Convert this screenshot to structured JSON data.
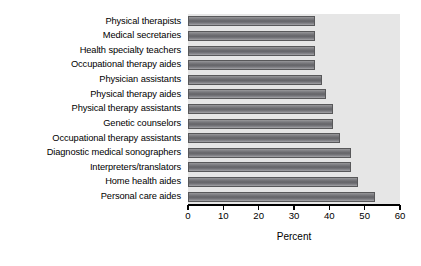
{
  "chart_data": {
    "type": "bar",
    "orientation": "horizontal",
    "title": "",
    "xlabel": "Percent",
    "ylabel": "",
    "xlim": [
      0,
      60
    ],
    "xticks": [
      0,
      10,
      20,
      30,
      40,
      50,
      60
    ],
    "grid": false,
    "legend": null,
    "categories": [
      "Physical therapists",
      "Medical secretaries",
      "Health specialty teachers",
      "Occupational therapy aides",
      "Physician assistants",
      "Physical therapy aides",
      "Physical therapy assistants",
      "Genetic counselors",
      "Occupational therapy assistants",
      "Diagnostic medical sonographers",
      "Interpreters/translators",
      "Home health aides",
      "Personal care aides"
    ],
    "values": [
      36,
      36,
      36,
      36,
      38,
      39,
      41,
      41,
      43,
      46,
      46,
      48,
      53
    ],
    "bar_color": "#6e6e72",
    "plot_background": "#e6e6e6"
  },
  "axis": {
    "tick_labels": [
      "0",
      "10",
      "20",
      "30",
      "40",
      "50",
      "60"
    ],
    "x_title": "Percent"
  }
}
